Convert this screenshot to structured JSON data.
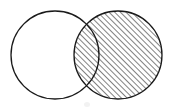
{
  "figure": {
    "kind": "venn-diagram",
    "title": "",
    "caption": "",
    "background_color": "#ffffff",
    "canvas": {
      "width": 174,
      "height": 110
    }
  },
  "chart_data": {
    "type": "diagram",
    "diagram_type": "venn",
    "title": "",
    "xlabel": "",
    "ylabel": "",
    "grid": false,
    "legend": null,
    "set_count": 2,
    "sets": [
      {
        "id": "left-circle",
        "label": "",
        "center_x": 55,
        "center_y": 55,
        "radius": 44,
        "fill": "none",
        "fill_color": "#ffffff",
        "stroke_color": "#1a1a1a",
        "stroke_width": 1.3,
        "shaded": false,
        "hatched": false
      },
      {
        "id": "right-circle",
        "label": "",
        "center_x": 118,
        "center_y": 55,
        "radius": 44,
        "fill": "hatch",
        "fill_color": "#ffffff",
        "stroke_color": "#1a1a1a",
        "stroke_width": 1.3,
        "shaded": true,
        "hatched": true
      }
    ],
    "hatch": {
      "pattern": "diagonal-lines",
      "direction": "lower-left-to-upper-right",
      "angle_degrees": 45,
      "spacing_px": 4,
      "line_width_px": 1.1,
      "line_color": "#1a1a1a"
    },
    "regions": [
      {
        "id": "left-only",
        "description": "left circle only",
        "shaded": false
      },
      {
        "id": "intersection",
        "description": "overlap of both circles",
        "shaded": true
      },
      {
        "id": "right-only",
        "description": "right circle only",
        "shaded": true
      },
      {
        "id": "outside",
        "description": "outside both circles",
        "shaded": false
      }
    ],
    "intersection": {
      "upper_point_x": 87,
      "upper_point_y": 15,
      "lower_point_x": 87,
      "lower_point_y": 93,
      "lens_left_x": 74,
      "lens_right_x": 99
    },
    "annotations": [],
    "labels": []
  },
  "colors": {
    "ink": "#1a1a1a",
    "paper": "#ffffff",
    "smudge": "#f2f2f2"
  }
}
